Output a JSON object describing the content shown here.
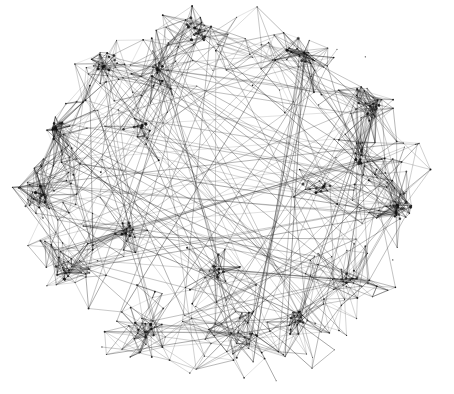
{
  "canvas": {
    "width": 454,
    "height": 394,
    "background_color": "#ffffff",
    "title": "network-graph-visualization"
  },
  "graph": {
    "kind": "force-directed-node-link-diagram",
    "edge_color": "#1a1a1a",
    "node_color": "#111111",
    "edge_width_min": 0.35,
    "edge_width_max": 1.1,
    "edge_opacity_min": 0.28,
    "edge_opacity_max": 0.85,
    "node_radius_min": 0.5,
    "node_radius_max": 1.6,
    "seed": 20240517,
    "node_count": 620,
    "shell_edge_count": 1750,
    "chord_count": 150,
    "description": "Dense hairball graph forming an oval blob with hollow interior and heavy perimeter clusters",
    "shape": {
      "center_x": 224,
      "center_y": 196,
      "radius_x": 196,
      "radius_y": 178,
      "hollow_inner_ratio": 0.46,
      "boundary_noise": 0.13
    },
    "clusters": [
      {
        "name": "upper-left-dense",
        "x": 106,
        "y": 62,
        "weight": 1.0,
        "spread": 34
      },
      {
        "name": "top-center",
        "x": 196,
        "y": 30,
        "weight": 0.78,
        "spread": 32
      },
      {
        "name": "top-right-arc",
        "x": 300,
        "y": 52,
        "weight": 0.72,
        "spread": 34
      },
      {
        "name": "right-upper",
        "x": 372,
        "y": 110,
        "weight": 0.74,
        "spread": 30
      },
      {
        "name": "right-middle-dense",
        "x": 398,
        "y": 210,
        "weight": 1.0,
        "spread": 30
      },
      {
        "name": "right-lower",
        "x": 346,
        "y": 280,
        "weight": 0.8,
        "spread": 32
      },
      {
        "name": "bottom-center",
        "x": 246,
        "y": 336,
        "weight": 0.88,
        "spread": 36
      },
      {
        "name": "bottom-left",
        "x": 150,
        "y": 330,
        "weight": 0.82,
        "spread": 34
      },
      {
        "name": "left-lower",
        "x": 66,
        "y": 272,
        "weight": 0.86,
        "spread": 32
      },
      {
        "name": "left-middle",
        "x": 40,
        "y": 196,
        "weight": 0.8,
        "spread": 30
      },
      {
        "name": "left-upper",
        "x": 56,
        "y": 130,
        "weight": 0.84,
        "spread": 30
      },
      {
        "name": "inner-upper-left",
        "x": 140,
        "y": 128,
        "weight": 0.62,
        "spread": 30
      },
      {
        "name": "inner-lower-center",
        "x": 216,
        "y": 268,
        "weight": 0.66,
        "spread": 34
      },
      {
        "name": "inner-right",
        "x": 318,
        "y": 186,
        "weight": 0.58,
        "spread": 32
      },
      {
        "name": "inner-lower-left",
        "x": 128,
        "y": 236,
        "weight": 0.6,
        "spread": 30
      },
      {
        "name": "upper-mid-left",
        "x": 160,
        "y": 72,
        "weight": 0.72,
        "spread": 28
      },
      {
        "name": "mid-right-arc",
        "x": 360,
        "y": 160,
        "weight": 0.68,
        "spread": 28
      },
      {
        "name": "lower-right-tail",
        "x": 300,
        "y": 318,
        "weight": 0.62,
        "spread": 30
      }
    ]
  }
}
